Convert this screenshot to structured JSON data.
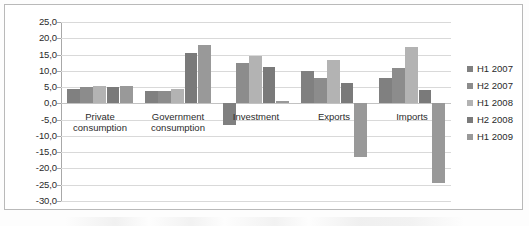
{
  "chart_data": {
    "type": "bar",
    "title": "",
    "subtitle": "",
    "xlabel": "",
    "ylabel": "",
    "ylim": [
      -30.0,
      25.0
    ],
    "ytick_step": 5.0,
    "ytick_labels": [
      "25,0",
      "20,0",
      "15,0",
      "10,0",
      "5,0",
      "0,0",
      "-5,0",
      "-10,0",
      "-15,0",
      "-20,0",
      "-25,0",
      "-30,0"
    ],
    "ytick_values": [
      25.0,
      20.0,
      15.0,
      10.0,
      5.0,
      0.0,
      -5.0,
      -10.0,
      -15.0,
      -20.0,
      -25.0,
      -30.0
    ],
    "grid": true,
    "legend_position": "right",
    "decimal_separator": ",",
    "categories": [
      "Private consumption",
      "Government consumption",
      "Investment",
      "Exports",
      "Imports"
    ],
    "category_lines": [
      [
        "Private",
        "consumption"
      ],
      [
        "Government",
        "consumption"
      ],
      [
        "Investment"
      ],
      [
        "Exports"
      ],
      [
        "Imports"
      ]
    ],
    "series": [
      {
        "name": "H1 2007",
        "color": "#808080",
        "values": [
          4.5,
          3.8,
          -6.5,
          9.8,
          7.9
        ]
      },
      {
        "name": "H2 2007",
        "color": "#8c8c8c",
        "values": [
          5.1,
          3.9,
          12.3,
          7.9,
          10.8
        ]
      },
      {
        "name": "H1 2008",
        "color": "#b3b3b3",
        "values": [
          5.4,
          4.5,
          14.6,
          13.3,
          17.3
        ]
      },
      {
        "name": "H2 2008",
        "color": "#7a7a7a",
        "values": [
          4.9,
          15.4,
          11.2,
          6.4,
          4.1
        ]
      },
      {
        "name": "H1 2009",
        "color": "#999999",
        "values": [
          5.2,
          18.0,
          0.8,
          -16.5,
          -24.5
        ]
      }
    ]
  },
  "legend": {
    "items": [
      {
        "label": "H1 2007"
      },
      {
        "label": "H2 2007"
      },
      {
        "label": "H1 2008"
      },
      {
        "label": "H2 2008"
      },
      {
        "label": "H1 2009"
      }
    ]
  }
}
